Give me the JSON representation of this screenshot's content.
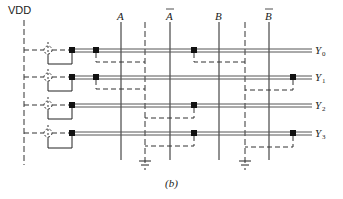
{
  "figure": {
    "caption": "(b)",
    "supply_label": "VDD",
    "ground_symbols": 2
  },
  "inputs": [
    {
      "label": "A",
      "bar": false
    },
    {
      "label": "A",
      "bar": true
    },
    {
      "label": "B",
      "bar": false
    },
    {
      "label": "B",
      "bar": true
    }
  ],
  "outputs": [
    {
      "label": "Y",
      "sub": "0"
    },
    {
      "label": "Y",
      "sub": "1"
    },
    {
      "label": "Y",
      "sub": "2"
    },
    {
      "label": "Y",
      "sub": "3"
    }
  ],
  "transistor_matrix": {
    "Y0": [
      "A",
      "B"
    ],
    "Y1": [
      "A",
      "B-bar"
    ],
    "Y2": [
      "A-bar",
      "B"
    ],
    "Y3": [
      "A-bar",
      "B-bar"
    ]
  },
  "colors": {
    "line": "#222222",
    "double_line": "#555555",
    "dashed": "#333333"
  }
}
